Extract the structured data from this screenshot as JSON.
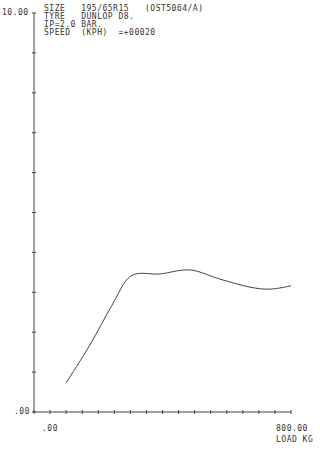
{
  "header": {
    "lines": [
      "SIZE   195/65R15   (OST5064/A)",
      "TYRE   DUNLOP D8.",
      "IP=2.0 BAR.",
      "SPEED  (KPH)  =+00020"
    ]
  },
  "axes": {
    "y_top_label": "10.00",
    "y_bottom_label": ".00",
    "x_left_label": ".00",
    "x_right_label": "800.00",
    "x_unit_label": "LOAD KG"
  },
  "chart_data": {
    "type": "line",
    "xlabel": "LOAD KG",
    "ylabel": "",
    "xlim": [
      0,
      800
    ],
    "ylim": [
      0,
      10
    ],
    "x_ticks_step": 50,
    "y_ticks_step": 1,
    "grid": false,
    "series": [
      {
        "name": "tyre response",
        "x": [
          100,
          174,
          243,
          302,
          392,
          486,
          579,
          672,
          735,
          800
        ],
        "values": [
          0.73,
          1.68,
          2.68,
          3.41,
          3.46,
          3.56,
          3.33,
          3.13,
          3.08,
          3.16
        ]
      }
    ]
  }
}
